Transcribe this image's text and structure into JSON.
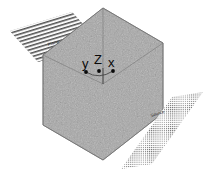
{
  "figure": {
    "background_color": "#ffffff"
  },
  "cube": {
    "name": "volume-cube",
    "fill_color": "#a8a8a8",
    "edge_color": "#6e6e6e",
    "texture": "speckled-noise",
    "projection": "isometric-hexagon",
    "vertices": [
      [
        103,
        8
      ],
      [
        163,
        43
      ],
      [
        163,
        113
      ],
      [
        103,
        160
      ],
      [
        43,
        125
      ],
      [
        43,
        55
      ]
    ],
    "center": [
      103,
      84
    ],
    "inner_edges": [
      [
        [
          103,
          8
        ],
        [
          103,
          84
        ]
      ],
      [
        [
          43,
          55
        ],
        [
          103,
          84
        ]
      ],
      [
        [
          163,
          43
        ],
        [
          103,
          84
        ]
      ]
    ]
  },
  "axes": {
    "name": "coordinate-axes",
    "origin": [
      103,
      84
    ],
    "arc_color": "#2a2a2a",
    "dot_color": "#0a0a0a",
    "items": [
      {
        "id": "y",
        "label": "y",
        "dot": [
          86,
          72
        ],
        "label_pos": [
          82,
          57
        ]
      },
      {
        "id": "z",
        "label": "Z",
        "dot": [
          99,
          71
        ],
        "label_pos": [
          94,
          53
        ]
      },
      {
        "id": "x",
        "label": "x",
        "dot": [
          113,
          71
        ],
        "label_pos": [
          108,
          56
        ]
      }
    ]
  },
  "planes": [
    {
      "id": "left-plane",
      "label": "Plane",
      "texture": "horizontal-stripes",
      "stripe_color": "#4a4a4a",
      "stripe_count": 13,
      "fill_color": "#b4b4b4",
      "corners": [
        [
          10,
          31
        ],
        [
          72,
          12
        ],
        [
          100,
          43
        ],
        [
          38,
          62
        ]
      ],
      "label_pos": [
        48,
        43
      ],
      "label_rotation": -17
    },
    {
      "id": "right-plane",
      "label": "Source",
      "texture": "dot-grid",
      "dot_color": "#3c3c3c",
      "fill_color": "#c0c0c0",
      "corners": [
        [
          172,
          97
        ],
        [
          203,
          92
        ],
        [
          152,
          164
        ],
        [
          121,
          169
        ]
      ],
      "label_pos": [
        151,
        114
      ],
      "label_rotation": -17
    }
  ],
  "colors": {
    "cube_gray": "#a8a8a8",
    "edge_gray": "#6e6e6e",
    "text_black": "#0a0a0a",
    "stripe_dark": "#4a4a4a",
    "background": "#ffffff"
  }
}
